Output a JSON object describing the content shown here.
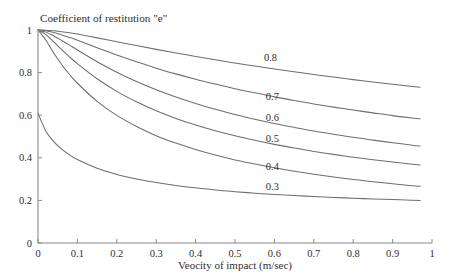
{
  "chart_data": {
    "type": "line",
    "title": "Coefficient of restitution \"e\"",
    "xlabel": "Veocity of impact (m/sec)",
    "ylabel": "",
    "xlim": [
      0,
      1
    ],
    "ylim": [
      0,
      1
    ],
    "grid": false,
    "legend_position": "inline-right-of-curves",
    "xticks": [
      "0",
      "0.1",
      "0.2",
      "0.3",
      "0.4",
      "0.5",
      "0.6",
      "0.7",
      "0.8",
      "0.9",
      "1"
    ],
    "xtick_values": [
      0,
      0.1,
      0.2,
      0.3,
      0.4,
      0.5,
      0.6,
      0.7,
      0.8,
      0.9,
      1
    ],
    "yticks": [
      "0",
      "0.2",
      "0.4",
      "0.6",
      "0.8",
      "1"
    ],
    "ytick_values": [
      0,
      0.2,
      0.4,
      0.6,
      0.8,
      1
    ],
    "x": [
      0.0,
      0.02,
      0.04,
      0.06,
      0.08,
      0.1,
      0.15,
      0.2,
      0.25,
      0.3,
      0.35,
      0.4,
      0.45,
      0.5,
      0.55,
      0.6,
      0.65,
      0.7,
      0.75,
      0.8,
      0.85,
      0.9,
      0.95,
      0.97
    ],
    "series": [
      {
        "name": "0.8",
        "label": "0.8",
        "label_x": 0.59,
        "label_y": 0.855,
        "values": [
          1.0,
          0.999,
          0.996,
          0.992,
          0.987,
          0.981,
          0.963,
          0.945,
          0.927,
          0.909,
          0.892,
          0.876,
          0.86,
          0.845,
          0.831,
          0.817,
          0.804,
          0.791,
          0.779,
          0.767,
          0.756,
          0.745,
          0.735,
          0.731
        ]
      },
      {
        "name": "0.7",
        "label": "0.7",
        "label_x": 0.595,
        "label_y": 0.67,
        "values": [
          1.0,
          0.996,
          0.988,
          0.977,
          0.965,
          0.952,
          0.917,
          0.883,
          0.851,
          0.821,
          0.794,
          0.769,
          0.746,
          0.724,
          0.705,
          0.686,
          0.669,
          0.653,
          0.638,
          0.624,
          0.611,
          0.598,
          0.587,
          0.583
        ]
      },
      {
        "name": "0.6",
        "label": "0.6",
        "label_x": 0.595,
        "label_y": 0.575,
        "values": [
          1.0,
          0.99,
          0.972,
          0.951,
          0.929,
          0.906,
          0.851,
          0.802,
          0.758,
          0.719,
          0.685,
          0.655,
          0.628,
          0.603,
          0.581,
          0.561,
          0.543,
          0.526,
          0.511,
          0.496,
          0.483,
          0.471,
          0.459,
          0.455
        ]
      },
      {
        "name": "0.5",
        "label": "0.5",
        "label_x": 0.595,
        "label_y": 0.475,
        "values": [
          1.0,
          0.978,
          0.944,
          0.908,
          0.874,
          0.842,
          0.771,
          0.712,
          0.663,
          0.621,
          0.585,
          0.554,
          0.527,
          0.503,
          0.482,
          0.463,
          0.446,
          0.43,
          0.416,
          0.403,
          0.391,
          0.38,
          0.37,
          0.366
        ]
      },
      {
        "name": "0.4",
        "label": "0.4",
        "label_x": 0.595,
        "label_y": 0.345,
        "values": [
          1.0,
          0.952,
          0.892,
          0.838,
          0.791,
          0.75,
          0.665,
          0.599,
          0.547,
          0.504,
          0.469,
          0.439,
          0.413,
          0.39,
          0.371,
          0.353,
          0.337,
          0.323,
          0.31,
          0.298,
          0.288,
          0.278,
          0.269,
          0.266
        ]
      },
      {
        "name": "0.3",
        "label": "0.3",
        "label_x": 0.595,
        "label_y": 0.25,
        "values": [
          0.61,
          0.525,
          0.476,
          0.441,
          0.414,
          0.392,
          0.351,
          0.322,
          0.301,
          0.284,
          0.27,
          0.259,
          0.249,
          0.241,
          0.234,
          0.228,
          0.223,
          0.218,
          0.214,
          0.21,
          0.207,
          0.204,
          0.201,
          0.2
        ]
      }
    ]
  },
  "style": {
    "curve_color": "#6e6e6e",
    "axis_color": "#8a8a8a",
    "text_color": "#2f2f2f",
    "background": "#ffffff"
  }
}
